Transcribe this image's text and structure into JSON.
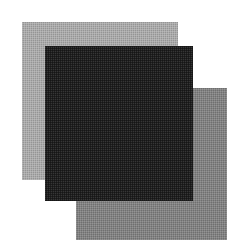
{
  "figure": {
    "background_color": "#ffffff",
    "width": 247,
    "height": 252,
    "texture": "dithered-halftone"
  },
  "shapes": [
    {
      "name": "light-gray-square",
      "label": "Light gray square",
      "shape": "square",
      "fill_color": "#ababab",
      "x": 22,
      "y": 22,
      "width": 156,
      "height": 158,
      "z": 1
    },
    {
      "name": "medium-gray-square",
      "label": "Medium gray square",
      "shape": "square",
      "fill_color": "#828282",
      "x": 76,
      "y": 88,
      "width": 151,
      "height": 152,
      "z": 2
    },
    {
      "name": "dark-square",
      "label": "Dark square",
      "shape": "square",
      "fill_color": "#1f1f1f",
      "x": 45,
      "y": 46,
      "width": 148,
      "height": 155,
      "z": 3
    }
  ]
}
